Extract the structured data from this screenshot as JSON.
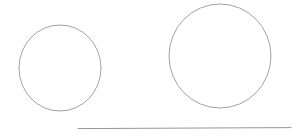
{
  "figure": {
    "background_color": "#ffffff",
    "width": 304,
    "height": 140,
    "stroke_color": "#8a8a8f",
    "faint_stroke_color": "#c9c9cc"
  },
  "shapes": {
    "small_circle": {
      "label": "small circle",
      "center_x": 60,
      "center_y": 68,
      "radius_x": 41,
      "radius_y": 43,
      "stroke_color": "#8a8a8f",
      "stroke_width": 0.8,
      "fill": "none"
    },
    "large_circle": {
      "label": "large circle",
      "center_x": 220,
      "center_y": 56,
      "radius_x": 51,
      "radius_y": 52,
      "stroke_color": "#8a8a8f",
      "stroke_width": 0.8,
      "fill": "none"
    },
    "baseline": {
      "label": "baseline",
      "x1": 78,
      "y1": 128.6,
      "x2": 291,
      "y2": 127.6,
      "stroke_color": "#8a8a8f",
      "stroke_width": 0.9
    }
  },
  "annotations": {
    "faint_mark": {
      "name": "erased annotation",
      "text": "",
      "x": 177,
      "y": 110,
      "color": "#c9c9cc"
    }
  }
}
